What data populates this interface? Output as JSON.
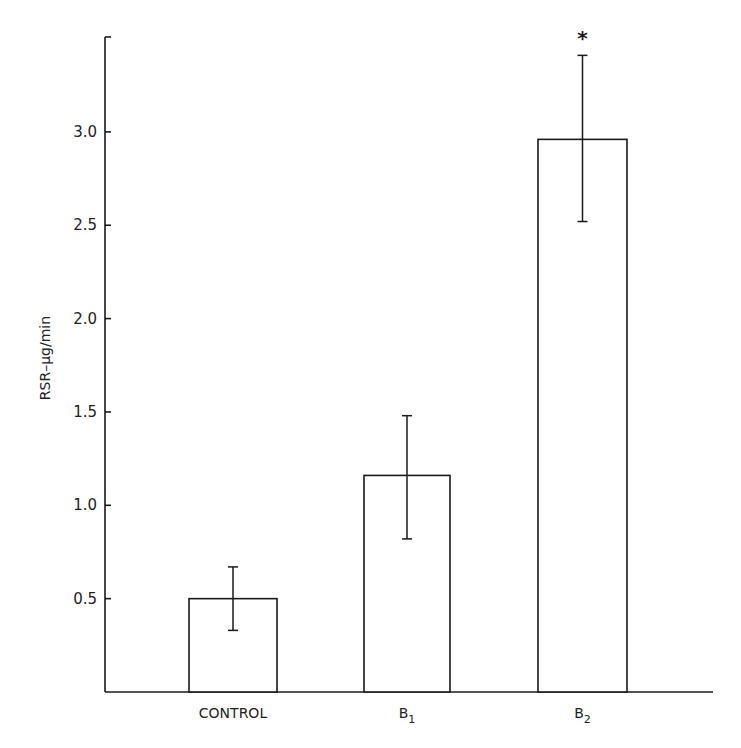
{
  "chart_data": {
    "type": "bar",
    "title": "",
    "xlabel": "",
    "ylabel": "RSR–μg/min",
    "categories": [
      "CONTROL",
      "B1",
      "B2"
    ],
    "category_display": [
      {
        "main": "CONTROL",
        "sub": ""
      },
      {
        "main": "B",
        "sub": "1"
      },
      {
        "main": "B",
        "sub": "2"
      }
    ],
    "values": [
      0.5,
      1.16,
      2.96
    ],
    "error_bars": [
      {
        "lower": 0.33,
        "upper": 0.67
      },
      {
        "lower": 0.82,
        "upper": 1.48
      },
      {
        "lower": 2.52,
        "upper": 3.41
      }
    ],
    "annotations": [
      {
        "category": "B2",
        "text": "*",
        "meaning": "significance marker above error bar"
      }
    ],
    "yticks": [
      "0.5",
      "1.0",
      "1.5",
      "2.0",
      "2.5",
      "3.0"
    ],
    "ytick_values": [
      0.5,
      1.0,
      1.5,
      2.0,
      2.5,
      3.0
    ],
    "ylim": [
      0,
      3.5
    ],
    "grid": false,
    "legend": null,
    "bar_fill": "#ffffff",
    "bar_stroke": "#1a1a1a"
  }
}
